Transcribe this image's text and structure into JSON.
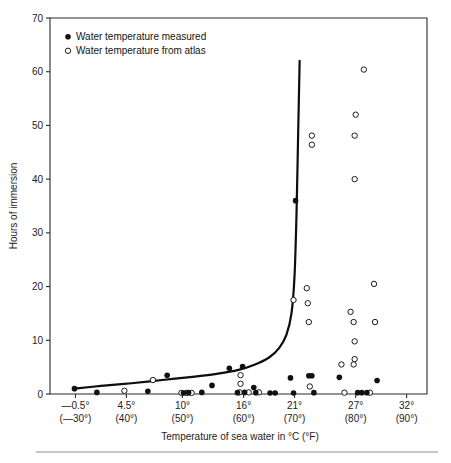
{
  "chart_data": {
    "type": "scatter",
    "title": "",
    "xlabel": "Temperature of sea water in °C (°F)",
    "ylabel": "Hours of immersion",
    "xlim": [
      -3,
      34
    ],
    "ylim": [
      0,
      70
    ],
    "grid": false,
    "legend_position": "top-left",
    "x_tick_values": [
      -0.5,
      4.5,
      10,
      16,
      21,
      27,
      32
    ],
    "x_tick_labels_c": [
      "—0.5°",
      "4.5°",
      "10°",
      "16°",
      "21°",
      "27°",
      "32°"
    ],
    "x_tick_labels_f": [
      "(—30°)",
      "(40°)",
      "(50°)",
      "(60°)",
      "(70°)",
      "(80°)",
      "(90°)"
    ],
    "y_tick_values": [
      0,
      10,
      20,
      30,
      40,
      50,
      60,
      70
    ],
    "y_tick_labels": [
      "0",
      "10",
      "20",
      "30",
      "40",
      "50",
      "60",
      "70"
    ],
    "series": [
      {
        "name": "Water temperature measured",
        "marker": "filled-circle",
        "color": "#111111",
        "points": [
          [
            -0.6,
            1.0
          ],
          [
            1.6,
            0.3
          ],
          [
            6.6,
            0.5
          ],
          [
            8.5,
            3.5
          ],
          [
            10.1,
            0.2
          ],
          [
            10.6,
            0.25
          ],
          [
            11.9,
            0.3
          ],
          [
            12.9,
            1.6
          ],
          [
            14.6,
            4.8
          ],
          [
            15.9,
            5.1
          ],
          [
            15.4,
            0.25
          ],
          [
            16.1,
            0.3
          ],
          [
            17.0,
            1.2
          ],
          [
            17.2,
            0.25
          ],
          [
            18.6,
            0.2
          ],
          [
            19.1,
            0.2
          ],
          [
            20.6,
            3.0
          ],
          [
            20.9,
            0.2
          ],
          [
            21.1,
            36.0
          ],
          [
            22.4,
            3.4
          ],
          [
            22.7,
            3.4
          ],
          [
            22.9,
            0.25
          ],
          [
            25.4,
            3.1
          ],
          [
            27.2,
            0.25
          ],
          [
            27.6,
            0.25
          ],
          [
            28.1,
            0.25
          ],
          [
            29.1,
            2.5
          ]
        ]
      },
      {
        "name": "Water temperature from atlas",
        "marker": "open-circle",
        "color": "#ffffff",
        "points": [
          [
            4.3,
            0.6
          ],
          [
            7.1,
            2.6
          ],
          [
            9.9,
            0.2
          ],
          [
            10.4,
            0.2
          ],
          [
            10.9,
            0.2
          ],
          [
            15.7,
            3.5
          ],
          [
            15.7,
            1.9
          ],
          [
            15.6,
            0.3
          ],
          [
            16.5,
            0.3
          ],
          [
            17.5,
            0.3
          ],
          [
            20.9,
            17.5
          ],
          [
            22.2,
            19.7
          ],
          [
            22.3,
            16.9
          ],
          [
            22.4,
            13.4
          ],
          [
            22.7,
            48.1
          ],
          [
            22.7,
            46.4
          ],
          [
            22.5,
            1.4
          ],
          [
            25.6,
            5.5
          ],
          [
            26.5,
            15.3
          ],
          [
            26.8,
            13.4
          ],
          [
            26.9,
            9.8
          ],
          [
            26.9,
            6.5
          ],
          [
            26.8,
            5.5
          ],
          [
            26.9,
            40.0
          ],
          [
            26.9,
            48.1
          ],
          [
            27.0,
            52.0
          ],
          [
            27.8,
            60.4
          ],
          [
            28.8,
            20.5
          ],
          [
            28.9,
            13.4
          ],
          [
            25.9,
            0.25
          ],
          [
            28.4,
            0.25
          ]
        ]
      }
    ],
    "fit_curve": {
      "name": "survival-threshold-curve",
      "points": [
        [
          -0.6,
          1.0
        ],
        [
          2.0,
          1.5
        ],
        [
          5.0,
          2.0
        ],
        [
          8.0,
          2.6
        ],
        [
          11.0,
          3.2
        ],
        [
          13.5,
          3.8
        ],
        [
          15.5,
          4.5
        ],
        [
          17.0,
          5.4
        ],
        [
          18.5,
          6.8
        ],
        [
          19.5,
          8.6
        ],
        [
          20.2,
          11.0
        ],
        [
          20.7,
          15.0
        ],
        [
          21.0,
          22.0
        ],
        [
          21.2,
          34.0
        ],
        [
          21.35,
          48.0
        ],
        [
          21.5,
          62.0
        ]
      ]
    }
  },
  "legend": {
    "items": [
      {
        "marker": "filled-circle",
        "label": "Water temperature measured"
      },
      {
        "marker": "open-circle",
        "label": "Water temperature from atlas"
      }
    ]
  }
}
